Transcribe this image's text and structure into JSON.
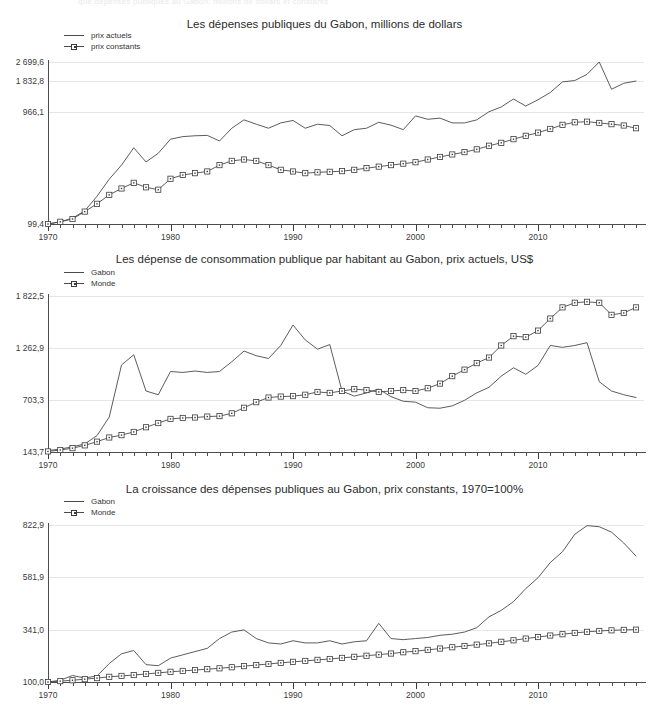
{
  "page": {
    "clipped_header_text": "que dépenses publiques au Gabon, millions de dollars et constants"
  },
  "charts": [
    {
      "id": "chart-depenses-publiques",
      "title": "Les dépenses publiques du Gabon, millions de dollars",
      "legend": [
        {
          "label": "prix actuels",
          "key": "line"
        },
        {
          "label": "prix constants",
          "key": "line-square"
        }
      ],
      "y_ticks": [
        "99,4",
        "966,1",
        "1 832,8",
        "2 699,6"
      ],
      "x_ticks": [
        "1970",
        "1980",
        "1990",
        "2000",
        "2010"
      ]
    },
    {
      "id": "chart-consommation-habitant",
      "title": "Les dépense de consommation publique par habitant au Gabon, prix actuels, US$",
      "legend": [
        {
          "label": "Gabon",
          "key": "line"
        },
        {
          "label": "Monde",
          "key": "line-square"
        }
      ],
      "y_ticks": [
        "143,7",
        "703,3",
        "1 262,9",
        "1 822,5"
      ],
      "x_ticks": [
        "1970",
        "1980",
        "1990",
        "2000",
        "2010"
      ]
    },
    {
      "id": "chart-croissance-depenses",
      "title": "La croissance des dépenses publiques au Gabon, prix constants, 1970=100%",
      "legend": [
        {
          "label": "Gabon",
          "key": "line"
        },
        {
          "label": "Monde",
          "key": "line-square"
        }
      ],
      "y_ticks": [
        "100,0",
        "341,0",
        "581,9",
        "822,9"
      ],
      "x_ticks": [
        "1970",
        "1980",
        "1990",
        "2000",
        "2010"
      ]
    }
  ],
  "chart_data": [
    {
      "type": "line",
      "id": "chart-depenses-publiques",
      "title": "Les dépenses publiques du Gabon, millions de dollars",
      "xlabel": "",
      "ylabel": "millions de dollars",
      "yscale": "log",
      "ylim": [
        99.4,
        2699.6
      ],
      "ytick_values": [
        99.4,
        966.1,
        1832.8,
        2699.6
      ],
      "ytick_labels": [
        "99,4",
        "966,1",
        "1 832,8",
        "2 699,6"
      ],
      "xlim": [
        1970,
        2018
      ],
      "xtick_values": [
        1970,
        1980,
        1990,
        2000,
        2010
      ],
      "grid": true,
      "legend_position": "upper-left-outside",
      "x": [
        1970,
        1971,
        1972,
        1973,
        1974,
        1975,
        1976,
        1977,
        1978,
        1979,
        1980,
        1981,
        1982,
        1983,
        1984,
        1985,
        1986,
        1987,
        1988,
        1989,
        1990,
        1991,
        1992,
        1993,
        1994,
        1995,
        1996,
        1997,
        1998,
        1999,
        2000,
        2001,
        2002,
        2003,
        2004,
        2005,
        2006,
        2007,
        2008,
        2009,
        2010,
        2011,
        2012,
        2013,
        2014,
        2015,
        2016,
        2017,
        2018
      ],
      "series": [
        {
          "name": "prix actuels",
          "marker": "none",
          "values": [
            99.4,
            104,
            112,
            130,
            175,
            248,
            330,
            470,
            352,
            420,
            560,
            590,
            600,
            605,
            540,
            700,
            830,
            760,
            700,
            780,
            820,
            700,
            760,
            740,
            600,
            680,
            700,
            790,
            745,
            680,
            900,
            840,
            860,
            780,
            780,
            830,
            980,
            1080,
            1270,
            1100,
            1250,
            1450,
            1800,
            1850,
            2100,
            2699,
            1550,
            1750,
            1830
          ]
        },
        {
          "name": "prix constants",
          "marker": "square",
          "values": [
            99.4,
            104,
            110,
            128,
            150,
            180,
            205,
            230,
            210,
            200,
            250,
            270,
            280,
            290,
            330,
            360,
            370,
            360,
            330,
            300,
            290,
            280,
            285,
            288,
            292,
            300,
            310,
            320,
            330,
            340,
            350,
            370,
            390,
            410,
            430,
            455,
            490,
            520,
            560,
            600,
            640,
            690,
            750,
            790,
            800,
            780,
            760,
            740,
            700
          ]
        }
      ]
    },
    {
      "type": "line",
      "id": "chart-consommation-habitant",
      "title": "Les dépense de consommation publique par habitant au Gabon, prix actuels, US$",
      "xlabel": "",
      "ylabel": "US$",
      "yscale": "linear",
      "ylim": [
        143.7,
        1822.5
      ],
      "ytick_values": [
        143.7,
        703.3,
        1262.9,
        1822.5
      ],
      "ytick_labels": [
        "143,7",
        "703,3",
        "1 262,9",
        "1 822,5"
      ],
      "xlim": [
        1970,
        2018
      ],
      "xtick_values": [
        1970,
        1980,
        1990,
        2000,
        2010
      ],
      "grid": true,
      "legend_position": "upper-left-outside",
      "x": [
        1970,
        1971,
        1972,
        1973,
        1974,
        1975,
        1976,
        1977,
        1978,
        1979,
        1980,
        1981,
        1982,
        1983,
        1984,
        1985,
        1986,
        1987,
        1988,
        1989,
        1990,
        1991,
        1992,
        1993,
        1994,
        1995,
        1996,
        1997,
        1998,
        1999,
        2000,
        2001,
        2002,
        2003,
        2004,
        2005,
        2006,
        2007,
        2008,
        2009,
        2010,
        2011,
        2012,
        2013,
        2014,
        2015,
        2016,
        2017,
        2018
      ],
      "series": [
        {
          "name": "Gabon",
          "marker": "none",
          "values": [
            160,
            175,
            200,
            230,
            320,
            520,
            1080,
            1190,
            800,
            760,
            1010,
            1000,
            1015,
            1000,
            1010,
            1115,
            1230,
            1180,
            1150,
            1290,
            1510,
            1350,
            1250,
            1300,
            800,
            745,
            780,
            820,
            740,
            690,
            680,
            620,
            615,
            640,
            700,
            780,
            840,
            960,
            1050,
            980,
            1075,
            1290,
            1270,
            1290,
            1320,
            900,
            800,
            760,
            730
          ]
        },
        {
          "name": "Monde",
          "marker": "square",
          "values": [
            150,
            165,
            185,
            215,
            255,
            300,
            325,
            360,
            410,
            455,
            500,
            510,
            515,
            525,
            530,
            560,
            620,
            680,
            730,
            740,
            745,
            760,
            790,
            780,
            800,
            820,
            810,
            790,
            800,
            810,
            800,
            830,
            880,
            960,
            1030,
            1100,
            1160,
            1290,
            1390,
            1380,
            1450,
            1580,
            1700,
            1750,
            1760,
            1750,
            1620,
            1640,
            1700,
            1822
          ]
        }
      ]
    },
    {
      "type": "line",
      "id": "chart-croissance-depenses",
      "title": "La croissance des dépenses publiques au Gabon, prix constants, 1970=100%",
      "xlabel": "",
      "ylabel": "1970=100%",
      "yscale": "linear",
      "ylim": [
        100.0,
        822.9
      ],
      "ytick_values": [
        100.0,
        341.0,
        581.9,
        822.9
      ],
      "ytick_labels": [
        "100,0",
        "341,0",
        "581,9",
        "822,9"
      ],
      "xlim": [
        1970,
        2018
      ],
      "xtick_values": [
        1970,
        1980,
        1990,
        2000,
        2010
      ],
      "grid": true,
      "legend_position": "upper-left-outside",
      "x": [
        1970,
        1971,
        1972,
        1973,
        1974,
        1975,
        1976,
        1977,
        1978,
        1979,
        1980,
        1981,
        1982,
        1983,
        1984,
        1985,
        1986,
        1987,
        1988,
        1989,
        1990,
        1991,
        1992,
        1993,
        1994,
        1995,
        1996,
        1997,
        1998,
        1999,
        2000,
        2001,
        2002,
        2003,
        2004,
        2005,
        2006,
        2007,
        2008,
        2009,
        2010,
        2011,
        2012,
        2013,
        2014,
        2015,
        2016,
        2017,
        2018
      ],
      "series": [
        {
          "name": "Gabon",
          "marker": "none",
          "values": [
            100,
            108,
            130,
            118,
            128,
            185,
            230,
            245,
            180,
            175,
            210,
            225,
            240,
            255,
            300,
            330,
            340,
            300,
            280,
            275,
            290,
            280,
            280,
            290,
            275,
            285,
            290,
            370,
            300,
            295,
            300,
            305,
            315,
            320,
            330,
            350,
            400,
            430,
            470,
            530,
            580,
            650,
            700,
            780,
            820,
            815,
            790,
            740,
            680
          ]
        },
        {
          "name": "Monde",
          "marker": "square",
          "values": [
            100,
            104,
            108,
            113,
            118,
            124,
            128,
            132,
            137,
            142,
            147,
            151,
            155,
            159,
            163,
            168,
            173,
            178,
            183,
            188,
            193,
            197,
            202,
            206,
            211,
            216,
            221,
            226,
            231,
            237,
            242,
            248,
            254,
            260,
            266,
            272,
            278,
            285,
            292,
            300,
            307,
            314,
            320,
            326,
            331,
            335,
            338,
            340,
            341
          ]
        }
      ]
    }
  ]
}
